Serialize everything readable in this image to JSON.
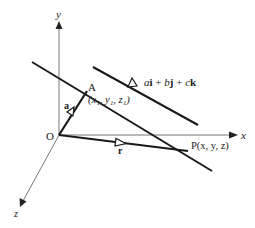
{
  "diagram": {
    "axes": {
      "x_label": "x",
      "y_label": "y",
      "z_label": "z",
      "origin_label": "O"
    },
    "points": {
      "A": {
        "label": "A",
        "coords": "(x₁, y₁, z₁)"
      },
      "P": {
        "label": "P(x, y, z)"
      }
    },
    "vectors": {
      "a": {
        "label": "a"
      },
      "r": {
        "label": "r"
      },
      "direction": {
        "label_a": "a",
        "label_i": "i",
        "plus1": " + ",
        "label_b": "b",
        "label_j": "j",
        "plus2": " + ",
        "label_c": "c",
        "label_k": "k"
      }
    },
    "colors": {
      "axis": "#777777",
      "line": "#1a1a1a",
      "text": "#222222"
    }
  }
}
